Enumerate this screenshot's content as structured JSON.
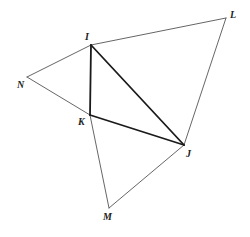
{
  "diagram": {
    "type": "geometry-figure",
    "points": {
      "I": {
        "x": 91,
        "y": 45,
        "label": "I",
        "lx": 85,
        "ly": 40
      },
      "L": {
        "x": 226,
        "y": 18,
        "label": "L",
        "lx": 230,
        "ly": 18
      },
      "N": {
        "x": 27,
        "y": 77,
        "label": "N",
        "lx": 17,
        "ly": 88
      },
      "K": {
        "x": 90,
        "y": 115,
        "label": "K",
        "lx": 78,
        "ly": 125
      },
      "J": {
        "x": 184,
        "y": 145,
        "label": "J",
        "lx": 186,
        "ly": 157
      },
      "M": {
        "x": 109,
        "y": 208,
        "label": "M",
        "lx": 103,
        "ly": 220
      }
    },
    "segments": [
      {
        "from": "I",
        "to": "L",
        "weight": "thin"
      },
      {
        "from": "L",
        "to": "J",
        "weight": "thin"
      },
      {
        "from": "I",
        "to": "N",
        "weight": "thin"
      },
      {
        "from": "N",
        "to": "K",
        "weight": "thin"
      },
      {
        "from": "K",
        "to": "M",
        "weight": "thin"
      },
      {
        "from": "M",
        "to": "J",
        "weight": "thin"
      },
      {
        "from": "I",
        "to": "K",
        "weight": "thick"
      },
      {
        "from": "I",
        "to": "J",
        "weight": "thick"
      },
      {
        "from": "K",
        "to": "J",
        "weight": "thick"
      }
    ]
  }
}
